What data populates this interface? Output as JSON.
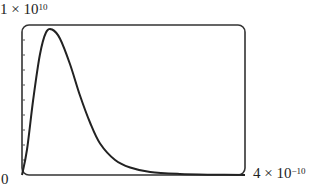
{
  "chart_data": {
    "type": "line",
    "title": "",
    "xlabel": "",
    "ylabel": "",
    "y_max_label": {
      "mantissa": "1 × 10",
      "exp": "10"
    },
    "x_max_label": {
      "mantissa": "4 × 10",
      "exp": "−10"
    },
    "origin_label": "0",
    "xlim": [
      0,
      4e-10
    ],
    "ylim": [
      0,
      10000000000.0
    ],
    "grid": false,
    "y_ticks": 9,
    "frame": "rounded-box",
    "series": [
      {
        "name": "curve",
        "color": "#222222",
        "x": [
          0,
          9e-12,
          2e-11,
          3.2e-11,
          4.3e-11,
          5.4e-11,
          6.8e-11,
          8.6e-11,
          1.04e-10,
          1.22e-10,
          1.4e-10,
          1.67e-10,
          1.94e-10,
          2.3e-10,
          2.83e-10,
          3.4e-10,
          4e-10
        ],
        "y": [
          0,
          1700000000.0,
          5000000000.0,
          8000000000.0,
          9500000000.0,
          9700000000.0,
          9100000000.0,
          7400000000.0,
          5300000000.0,
          3500000000.0,
          2100000000.0,
          1000000000.0,
          500000000.0,
          200000000.0,
          70000000.0,
          20000000.0,
          0
        ]
      }
    ]
  }
}
